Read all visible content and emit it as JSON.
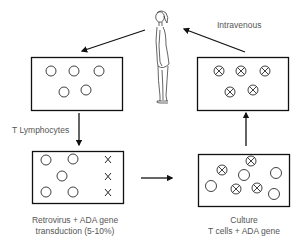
{
  "diagram": {
    "labels": {
      "intravenous": "Intravenous",
      "t_lymphocytes": "T Lymphocytes",
      "transduction_line1": "Retrovirus + ADA gene",
      "transduction_line2": "transduction (5-10%)",
      "culture_line1": "Culture",
      "culture_line2": "T cells + ADA gene"
    },
    "nodes": [
      {
        "id": "patient",
        "type": "human-figure"
      },
      {
        "id": "harvested-cells",
        "type": "box",
        "cells": {
          "plain": 5,
          "marked": 0,
          "x_marks": 0
        }
      },
      {
        "id": "transduction",
        "type": "box",
        "cells": {
          "plain": 5,
          "marked": 0,
          "x_marks": 3
        }
      },
      {
        "id": "culture",
        "type": "box",
        "cells": {
          "plain": 4,
          "marked": 4,
          "x_marks": 0
        }
      },
      {
        "id": "modified-cells",
        "type": "box",
        "cells": {
          "plain": 0,
          "marked": 5,
          "x_marks": 0
        }
      }
    ],
    "edges": [
      {
        "from": "patient",
        "to": "harvested-cells",
        "label": ""
      },
      {
        "from": "harvested-cells",
        "to": "transduction",
        "label": "T Lymphocytes"
      },
      {
        "from": "transduction",
        "to": "culture",
        "label": ""
      },
      {
        "from": "culture",
        "to": "modified-cells",
        "label": ""
      },
      {
        "from": "modified-cells",
        "to": "patient",
        "label": "Intravenous"
      }
    ],
    "colors": {
      "stroke": "#111111",
      "label": "#555555"
    }
  }
}
